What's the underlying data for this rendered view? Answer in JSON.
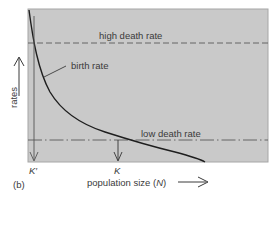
{
  "figure": {
    "panel_label": "(b)",
    "y_axis_label": "rates",
    "x_axis_label_text": "population size (",
    "x_axis_label_symbol": "N",
    "x_axis_label_close": ")",
    "lines": {
      "high_death_rate": "high death rate",
      "birth_rate": "birth rate",
      "low_death_rate": "low death rate"
    },
    "markers": {
      "k_prime": "K′",
      "k": "K"
    },
    "colors": {
      "plot_background": "#c9c9c9",
      "plot_border": "#9a9a9a",
      "curve": "#1e1e1e",
      "dashed_line": "#5a5a5a",
      "text": "#3a3a3a"
    }
  }
}
